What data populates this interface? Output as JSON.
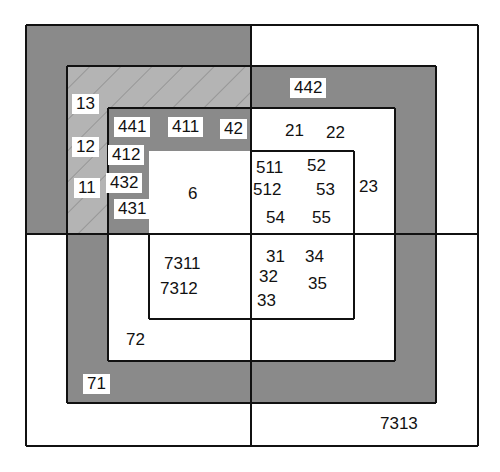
{
  "colors": {
    "gray": "#8a8a8a",
    "hatch_bg": "#b4b4b4",
    "hatch_line": "#8c8c8c",
    "white": "#ffffff",
    "line": "#111111"
  },
  "geometry": {
    "divider_x": 251,
    "divider_y": 234,
    "rects": [
      {
        "name": "outer",
        "x1": 26,
        "y1": 25,
        "x2": 478,
        "y2": 446,
        "tl_fill": "gray",
        "rest_fill": "white"
      },
      {
        "name": "second",
        "x1": 67,
        "y1": 66,
        "x2": 436,
        "y2": 403,
        "tl_fill": "hatch",
        "rest_fill": "gray"
      },
      {
        "name": "third",
        "x1": 108,
        "y1": 108,
        "x2": 395,
        "y2": 361,
        "tl_fill": "gray",
        "rest_fill": "white"
      },
      {
        "name": "inner",
        "x1": 149,
        "y1": 151,
        "x2": 354,
        "y2": 319,
        "tl_fill": "none",
        "rest_fill": "white"
      }
    ]
  },
  "labels": [
    {
      "text": "13",
      "x": 72,
      "y": 94,
      "box": true
    },
    {
      "text": "12",
      "x": 72,
      "y": 137,
      "box": true
    },
    {
      "text": "11",
      "x": 74,
      "y": 178,
      "box": true
    },
    {
      "text": "441",
      "x": 114,
      "y": 117,
      "box": true
    },
    {
      "text": "411",
      "x": 168,
      "y": 117,
      "box": true
    },
    {
      "text": "42",
      "x": 220,
      "y": 119,
      "box": true
    },
    {
      "text": "412",
      "x": 108,
      "y": 145,
      "box": true
    },
    {
      "text": "432",
      "x": 106,
      "y": 173,
      "box": true
    },
    {
      "text": "431",
      "x": 114,
      "y": 199,
      "box": true
    },
    {
      "text": "6",
      "x": 184,
      "y": 184,
      "box": true
    },
    {
      "text": "442",
      "x": 290,
      "y": 78,
      "box": true
    },
    {
      "text": "21",
      "x": 285,
      "y": 121,
      "box": false
    },
    {
      "text": "22",
      "x": 326,
      "y": 123,
      "box": false
    },
    {
      "text": "511",
      "x": 256,
      "y": 158,
      "box": false
    },
    {
      "text": "52",
      "x": 307,
      "y": 156,
      "box": false
    },
    {
      "text": "512",
      "x": 253,
      "y": 180,
      "box": false
    },
    {
      "text": "53",
      "x": 316,
      "y": 180,
      "box": false
    },
    {
      "text": "23",
      "x": 359,
      "y": 177,
      "box": false
    },
    {
      "text": "54",
      "x": 266,
      "y": 208,
      "box": false
    },
    {
      "text": "55",
      "x": 312,
      "y": 208,
      "box": false
    },
    {
      "text": "7311",
      "x": 164,
      "y": 254,
      "box": false
    },
    {
      "text": "7312",
      "x": 160,
      "y": 279,
      "box": false
    },
    {
      "text": "31",
      "x": 266,
      "y": 247,
      "box": false
    },
    {
      "text": "34",
      "x": 305,
      "y": 247,
      "box": false
    },
    {
      "text": "32",
      "x": 259,
      "y": 267,
      "box": false
    },
    {
      "text": "35",
      "x": 308,
      "y": 274,
      "box": false
    },
    {
      "text": "33",
      "x": 257,
      "y": 291,
      "box": false
    },
    {
      "text": "72",
      "x": 126,
      "y": 330,
      "box": false
    },
    {
      "text": "71",
      "x": 83,
      "y": 374,
      "box": true
    },
    {
      "text": "7313",
      "x": 380,
      "y": 414,
      "box": false
    }
  ]
}
